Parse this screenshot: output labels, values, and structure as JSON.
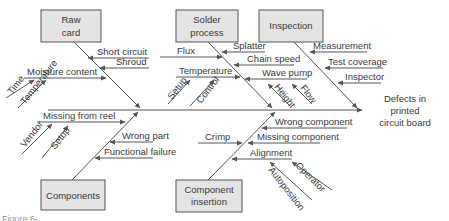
{
  "diagram": {
    "type": "cause-and-effect (fishbone)",
    "effect": [
      "Defects in",
      "printed",
      "circuit board"
    ],
    "categories": {
      "raw_card": {
        "label": [
          "Raw",
          "card"
        ],
        "causes": [
          "Short circuit",
          "Shroud",
          "Moisture content"
        ],
        "sub_causes": {
          "Moisture content": [
            "Time",
            "Temperature"
          ]
        }
      },
      "solder_process": {
        "label": [
          "Solder",
          "process"
        ],
        "causes": [
          "Flux",
          "Splatter",
          "Chain speed",
          "Temperature",
          "Wave pump"
        ],
        "sub_causes": {
          "Temperature": [
            "Setup",
            "Control"
          ],
          "Wave pump": [
            "Height",
            "Flow"
          ]
        }
      },
      "inspection": {
        "label": [
          "Inspection"
        ],
        "causes": [
          "Measurement",
          "Test coverage",
          "Inspector"
        ]
      },
      "components": {
        "label": [
          "Components"
        ],
        "causes": [
          "Missing from reel",
          "Wrong part",
          "Functional failure"
        ],
        "sub_causes": {
          "Missing from reel": [
            "Vendor",
            "Setup"
          ]
        }
      },
      "component_insertion": {
        "label": [
          "Component",
          "insertion"
        ],
        "causes": [
          "Wrong component",
          "Crimp",
          "Missing component",
          "Alignment"
        ],
        "sub_causes": {
          "Alignment": [
            "Autoposition",
            "Operator"
          ]
        }
      }
    },
    "caption": "Figure 6-..."
  }
}
